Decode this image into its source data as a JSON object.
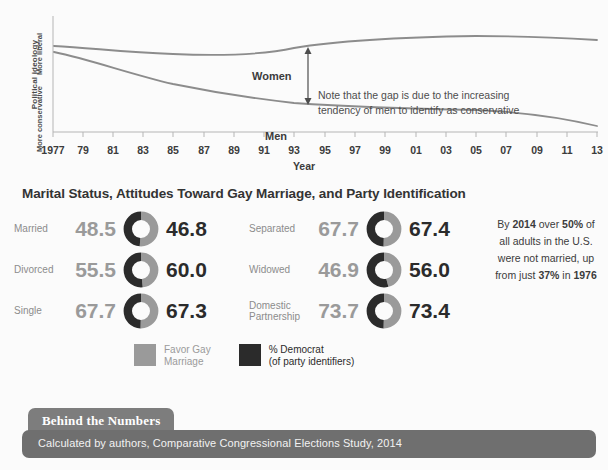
{
  "chart_data": [
    {
      "type": "line",
      "title": "",
      "xlabel": "Year",
      "ylabel": "Political ideology",
      "ylabel_top": "More liberal",
      "ylabel_bottom": "More conservative",
      "grid": false,
      "legend_position": "inline-labels",
      "x": [
        1977,
        1979,
        1981,
        1983,
        1985,
        1987,
        1989,
        1991,
        1993,
        1995,
        1997,
        1999,
        2001,
        2003,
        2005,
        2007,
        2009,
        2011,
        2013
      ],
      "tick_labels": [
        "1977",
        "79",
        "81",
        "83",
        "85",
        "87",
        "89",
        "91",
        "93",
        "95",
        "97",
        "99",
        "01",
        "03",
        "05",
        "07",
        "09",
        "11",
        "13"
      ],
      "series": [
        {
          "name": "Women",
          "color": "#8c8c8c",
          "values": [
            4.06,
            4.04,
            4.01,
            3.99,
            3.98,
            3.98,
            4.0,
            4.03,
            4.07,
            4.1,
            4.12,
            4.13,
            4.14,
            4.15,
            4.16,
            4.17,
            4.16,
            4.14,
            4.13
          ]
        },
        {
          "name": "Men",
          "color": "#8c8c8c",
          "values": [
            4.0,
            3.92,
            3.84,
            3.76,
            3.69,
            3.63,
            3.58,
            3.54,
            3.51,
            3.49,
            3.48,
            3.48,
            3.47,
            3.46,
            3.45,
            3.43,
            3.39,
            3.33,
            3.27
          ]
        }
      ],
      "annotation": {
        "line1": "Note that the gap is due to the increasing",
        "line2": "tendency of men to identify as conservative",
        "arrow": "double-headed-vertical-arrow"
      }
    },
    {
      "type": "table",
      "title": "Marital Status, Attitudes Toward Gay Marriage,  and Party Identification",
      "columns": [
        "Marital status",
        "Favor Gay Marriage",
        "% Democrat (of party identifiers)"
      ],
      "rows": [
        {
          "label": "Married",
          "favor_gay_marriage": "48.5",
          "percent_democrat": "46.8"
        },
        {
          "label": "Divorced",
          "favor_gay_marriage": "55.5",
          "percent_democrat": "60.0"
        },
        {
          "label": "Single",
          "favor_gay_marriage": "67.7",
          "percent_democrat": "67.3"
        },
        {
          "label": "Separated",
          "favor_gay_marriage": "67.7",
          "percent_democrat": "67.4"
        },
        {
          "label": "Widowed",
          "favor_gay_marriage": "46.9",
          "percent_democrat": "56.0"
        },
        {
          "label": "Domestic Partnership",
          "favor_gay_marriage": "73.7",
          "percent_democrat": "73.4"
        }
      ]
    }
  ],
  "chart": {
    "y_axis": {
      "title": "Political ideology",
      "top_label": "More liberal",
      "bottom_label": "More conservative"
    },
    "x_axis": {
      "title": "Year",
      "ticks": [
        "1977",
        "79",
        "81",
        "83",
        "85",
        "87",
        "89",
        "91",
        "93",
        "95",
        "97",
        "99",
        "01",
        "03",
        "05",
        "07",
        "09",
        "11",
        "13"
      ]
    },
    "series_labels": {
      "women": "Women",
      "men": "Men"
    },
    "annotation": {
      "line1": "Note that the gap is due to the increasing",
      "line2": "tendency of men to identify as conservative"
    }
  },
  "donut_section": {
    "title": "Marital Status, Attitudes Toward Gay Marriage,  and Party Identification",
    "rows_left": [
      {
        "label": "Married",
        "left_value": "48.5",
        "right_value": "46.8"
      },
      {
        "label": "Divorced",
        "left_value": "55.5",
        "right_value": "60.0"
      },
      {
        "label": "Single",
        "left_value": "67.7",
        "right_value": "67.3"
      }
    ],
    "rows_right": [
      {
        "label": "Separated",
        "left_value": "67.7",
        "right_value": "67.4"
      },
      {
        "label": "Widowed",
        "left_value": "46.9",
        "right_value": "56.0"
      },
      {
        "label": "Domestic Partnership",
        "left_value": "73.7",
        "right_value": "73.4"
      }
    ]
  },
  "legend": {
    "items": [
      {
        "swatch_color": "#9a9a9a",
        "line1": "Favor Gay",
        "line2": "Marriage",
        "tone": "gray"
      },
      {
        "swatch_color": "#2b2b2b",
        "line1": "% Democrat",
        "line2": "(of party identifiers)",
        "tone": "dark"
      }
    ]
  },
  "side_note": {
    "parts": [
      "By ",
      "2014",
      " over ",
      "50%",
      " of all adults in the U.S. were not married, up from just ",
      "37%",
      " in ",
      "1976"
    ]
  },
  "footer": {
    "tab_label": "Behind the Numbers",
    "source_text": "Calculated by authors, Comparative Congressional Elections Study, 2014",
    "tab_color": "#7d7d7d",
    "bar_color": "#6f6f6f"
  },
  "colors": {
    "gray": "#9a9a9a",
    "dark": "#2b2b2b",
    "line": "#8c8c8c",
    "axis": "#b5b5b5",
    "background": "#fbfbfb"
  }
}
